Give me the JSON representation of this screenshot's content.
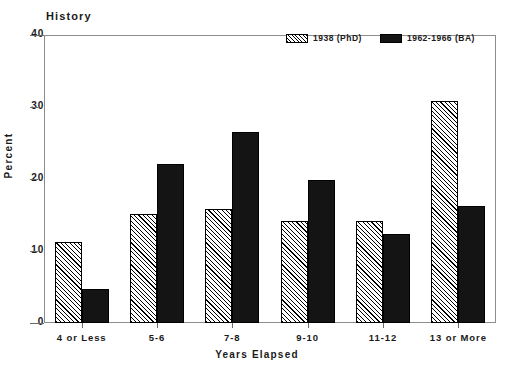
{
  "chart_data": {
    "type": "bar",
    "title": "History",
    "xlabel": "Years Elapsed",
    "ylabel": "Percent",
    "categories": [
      "4 or Less",
      "5-6",
      "7-8",
      "9-10",
      "11-12",
      "13 or More"
    ],
    "series": [
      {
        "name": "1938 (PhD)",
        "fill": "diagonal-hatch",
        "color": "#ffffff",
        "values": [
          11.3,
          15.2,
          15.9,
          14.1,
          14.2,
          30.9
        ]
      },
      {
        "name": "1962-1966 (BA)",
        "fill": "solid",
        "color": "#141414",
        "values": [
          4.7,
          22.1,
          26.5,
          19.8,
          12.3,
          16.3
        ]
      }
    ],
    "ylim": [
      0,
      40
    ],
    "yticks": [
      0,
      10,
      20,
      30,
      40
    ],
    "ytick_labels": [
      "0",
      "10",
      "20",
      "30",
      "40"
    ],
    "grid": false,
    "legend_position": "top-right-inside",
    "frame_color": "#8d8d8d",
    "bar_outline_color": "#000000"
  },
  "legend": {
    "entries": [
      {
        "label": "1938 (PhD)"
      },
      {
        "label": "1962-1966 (BA)"
      }
    ]
  }
}
